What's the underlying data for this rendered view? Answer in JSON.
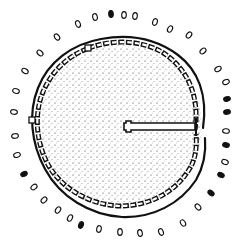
{
  "diagram": {
    "type": "archaeological-plan",
    "colors": {
      "ink": "#111111",
      "background": "#ffffff",
      "stipple": "#333333"
    },
    "center": [
      120,
      124
    ],
    "outer_wall_radius": 97,
    "inner_stone_ring_radius": 88,
    "floor_radius": 82,
    "entrance": {
      "orientation": "east",
      "passage_from": [
        126,
        126
      ],
      "passage_to": [
        195,
        126
      ]
    },
    "postholes": [
      {
        "x": 95,
        "y": 17,
        "filled": false
      },
      {
        "x": 111,
        "y": 14,
        "filled": true
      },
      {
        "x": 124,
        "y": 15,
        "filled": false
      },
      {
        "x": 135,
        "y": 16,
        "filled": false
      },
      {
        "x": 155,
        "y": 22,
        "filled": false
      },
      {
        "x": 170,
        "y": 29,
        "filled": false
      },
      {
        "x": 189,
        "y": 35,
        "filled": false
      },
      {
        "x": 203,
        "y": 51,
        "filled": false
      },
      {
        "x": 218,
        "y": 69,
        "filled": false
      },
      {
        "x": 226,
        "y": 82,
        "filled": false
      },
      {
        "x": 227,
        "y": 99,
        "filled": true
      },
      {
        "x": 227,
        "y": 112,
        "filled": true
      },
      {
        "x": 226,
        "y": 131,
        "filled": false
      },
      {
        "x": 226,
        "y": 145,
        "filled": true
      },
      {
        "x": 225,
        "y": 162,
        "filled": false
      },
      {
        "x": 221,
        "y": 175,
        "filled": true
      },
      {
        "x": 211,
        "y": 193,
        "filled": true
      },
      {
        "x": 198,
        "y": 207,
        "filled": false
      },
      {
        "x": 183,
        "y": 223,
        "filled": false
      },
      {
        "x": 161,
        "y": 232,
        "filled": false
      },
      {
        "x": 140,
        "y": 233,
        "filled": false
      },
      {
        "x": 120,
        "y": 232,
        "filled": false
      },
      {
        "x": 99,
        "y": 229,
        "filled": false
      },
      {
        "x": 81,
        "y": 225,
        "filled": true
      },
      {
        "x": 70,
        "y": 218,
        "filled": false
      },
      {
        "x": 58,
        "y": 210,
        "filled": false
      },
      {
        "x": 44,
        "y": 200,
        "filled": false
      },
      {
        "x": 34,
        "y": 187,
        "filled": false
      },
      {
        "x": 24,
        "y": 174,
        "filled": true
      },
      {
        "x": 17,
        "y": 155,
        "filled": false
      },
      {
        "x": 15,
        "y": 136,
        "filled": false
      },
      {
        "x": 14,
        "y": 112,
        "filled": false
      },
      {
        "x": 16,
        "y": 91,
        "filled": false
      },
      {
        "x": 25,
        "y": 71,
        "filled": false
      },
      {
        "x": 40,
        "y": 53,
        "filled": false
      },
      {
        "x": 57,
        "y": 37,
        "filled": false
      },
      {
        "x": 78,
        "y": 24,
        "filled": false
      }
    ],
    "markers": [
      {
        "x": 88,
        "y": 48,
        "shape": "square"
      },
      {
        "x": 32,
        "y": 120,
        "shape": "square"
      }
    ]
  }
}
